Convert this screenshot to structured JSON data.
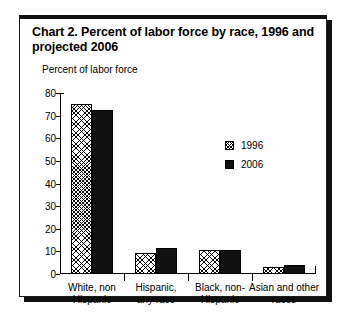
{
  "chart_data": {
    "type": "bar",
    "title": "Chart 2. Percent of labor force by race, 1996 and projected 2006",
    "subtitle": "",
    "xlabel": "",
    "ylabel": "Percent of labor force",
    "ylim": [
      0,
      80
    ],
    "yticks": [
      0,
      10,
      20,
      30,
      40,
      50,
      60,
      70,
      80
    ],
    "ytick_labels": [
      "0",
      "10",
      "20",
      "30",
      "40",
      "50",
      "60",
      "70",
      "80"
    ],
    "grid": false,
    "legend_position": "upper-right-inside",
    "categories": [
      "White, non Hispanic",
      "Hispanic, any race",
      "Black, non-Hispanic",
      "Asian and other races"
    ],
    "category_lines": [
      [
        "White, non",
        "Hispanic"
      ],
      [
        "Hispanic,",
        "any race"
      ],
      [
        "Black, non-",
        "Hispanic"
      ],
      [
        "Asian and other",
        "races"
      ]
    ],
    "series": [
      {
        "name": "1996",
        "fill": "hatched",
        "color": "#ffffff",
        "values": [
          75.3,
          9.2,
          10.7,
          3.1
        ]
      },
      {
        "name": "2006",
        "fill": "solid",
        "color": "#111111",
        "values": [
          72.5,
          11.4,
          10.8,
          4.2
        ]
      }
    ]
  }
}
